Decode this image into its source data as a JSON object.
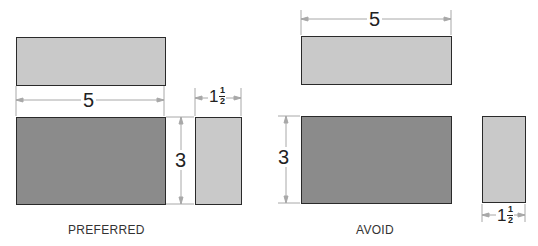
{
  "colors": {
    "light_fill": "#c9c9c9",
    "dark_fill": "#8b8b8b",
    "outline": "#2a2a2a",
    "dimension_line": "#a8a8a8"
  },
  "preferred": {
    "caption": "PREFERRED",
    "width_dimension": "5",
    "height_dimension": "3",
    "depth_dimension": {
      "whole": "1",
      "numerator": "1",
      "denominator": "2"
    }
  },
  "avoid": {
    "caption": "AVOID",
    "width_dimension": "5",
    "height_dimension": "3",
    "depth_dimension": {
      "whole": "1",
      "numerator": "1",
      "denominator": "2"
    }
  }
}
